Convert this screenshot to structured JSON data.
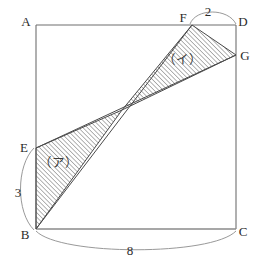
{
  "figure": {
    "background_color": "#ffffff",
    "line_color": "#6f6f6f",
    "hatch_color": "#707070",
    "label_color": "#2b2b2b"
  },
  "vertices": [
    {
      "id": "A",
      "label": "A",
      "x": 36,
      "y": 25,
      "label_x": 26,
      "label_y": 26
    },
    {
      "id": "B",
      "label": "B",
      "x": 36,
      "y": 229,
      "label_x": 25,
      "label_y": 239
    },
    {
      "id": "C",
      "label": "C",
      "x": 236,
      "y": 229,
      "label_x": 243,
      "label_y": 236
    },
    {
      "id": "D",
      "label": "D",
      "x": 236,
      "y": 25,
      "label_x": 241,
      "label_y": 26
    },
    {
      "id": "E",
      "label": "E",
      "x": 36,
      "y": 148,
      "label_x": 24,
      "label_y": 152
    },
    {
      "id": "F",
      "label": "F",
      "x": 192,
      "y": 25,
      "label_x": 183,
      "label_y": 22
    },
    {
      "id": "G",
      "label": "G",
      "x": 236,
      "y": 55,
      "label_x": 243,
      "label_y": 60
    }
  ],
  "intersection": {
    "id": "P",
    "x": 122,
    "y": 110
  },
  "regions": [
    {
      "id": "ア",
      "label": "（ア）",
      "label_x": 58,
      "label_y": 167,
      "polygon": "36,148 122,110 36,229",
      "hatched": true
    },
    {
      "id": "イ",
      "label": "（イ）",
      "label_x": 182,
      "label_y": 64,
      "polygon": "192,25 236,55 122,110",
      "hatched": true
    }
  ],
  "measurements": [
    {
      "id": "be",
      "label": "3",
      "label_x": 18,
      "label_y": 197,
      "segment": "B-E"
    },
    {
      "id": "fd",
      "label": "2",
      "label_x": 208,
      "label_y": 16,
      "segment": "F-D"
    },
    {
      "id": "bc",
      "label": "8",
      "label_x": 130,
      "label_y": 255,
      "segment": "B-C"
    }
  ]
}
